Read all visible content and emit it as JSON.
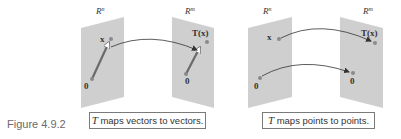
{
  "figure": {
    "label": "Figure 4.9.2",
    "colors": {
      "plane": "#cfcfcf",
      "point": "#8a8a8a",
      "arrow": "#333333",
      "vector": "#6a6a6a"
    },
    "panels": [
      {
        "id": "vectors",
        "domain_label": "R",
        "domain_exp": "n",
        "codomain_label": "R",
        "codomain_exp": "m",
        "point_x_label": "x",
        "point_Tx_label": "T(x)",
        "origin_label_left": "0",
        "origin_label_right": "0",
        "caption_T": "T",
        "caption_rest": " maps vectors to vectors."
      },
      {
        "id": "points",
        "domain_label": "R",
        "domain_exp": "n",
        "codomain_label": "R",
        "codomain_exp": "m",
        "point_x_label": "x",
        "point_Tx_label": "T(x)",
        "origin_label_left": "0",
        "origin_label_right": "0",
        "caption_T": "T",
        "caption_rest": " maps points to points."
      }
    ]
  }
}
